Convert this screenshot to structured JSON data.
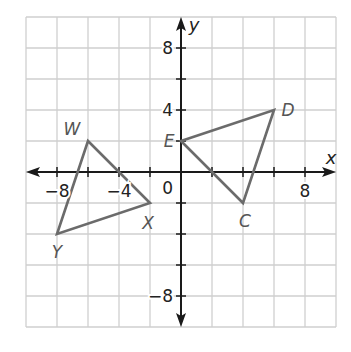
{
  "chart_data": {
    "type": "scatter",
    "subtype": "coordinate-plane-polygons",
    "xlabel": "x",
    "ylabel": "y",
    "xlim": [
      -10,
      10
    ],
    "ylim": [
      -10,
      10
    ],
    "grid": true,
    "grid_step": 2,
    "x_tick_labels": [
      {
        "value": -8,
        "text": "−8"
      },
      {
        "value": -4,
        "text": "−4"
      },
      {
        "value": 8,
        "text": "8"
      }
    ],
    "y_tick_labels": [
      {
        "value": 8,
        "text": "8"
      },
      {
        "value": 4,
        "text": "4"
      },
      {
        "value": -8,
        "text": "−8"
      }
    ],
    "origin_label": "0",
    "polygons": [
      {
        "name": "Triangle WXY",
        "vertices": [
          {
            "label": "W",
            "x": -6,
            "y": 2
          },
          {
            "label": "X",
            "x": -2,
            "y": -2
          },
          {
            "label": "Y",
            "x": -8,
            "y": -4
          }
        ]
      },
      {
        "name": "Triangle EDC",
        "vertices": [
          {
            "label": "E",
            "x": 0,
            "y": 2
          },
          {
            "label": "D",
            "x": 6,
            "y": 4
          },
          {
            "label": "C",
            "x": 4,
            "y": -2
          }
        ]
      }
    ],
    "colors": {
      "grid": "#cfcfcf",
      "axis": "#1a1a1a",
      "polygon_stroke": "#6b6b6b",
      "vertex_label": "#555555"
    }
  }
}
